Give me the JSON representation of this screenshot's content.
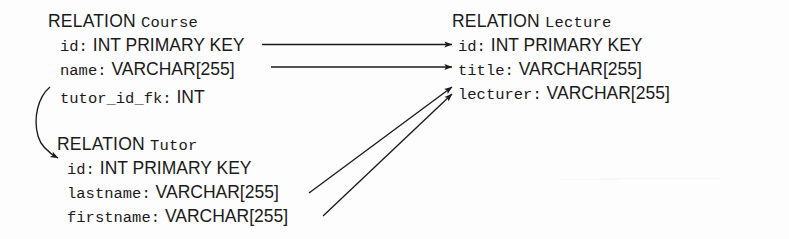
{
  "diagram": {
    "title_keyword": "RELATION",
    "relations": [
      {
        "id": "course",
        "name": "Course",
        "fields": [
          {
            "name": "id:",
            "type": "INT PRIMARY KEY"
          },
          {
            "name": "name:",
            "type": "VARCHAR[255]"
          },
          {
            "name": "tutor_id_fk:",
            "type": "INT"
          }
        ]
      },
      {
        "id": "lecture",
        "name": "Lecture",
        "fields": [
          {
            "name": "id:",
            "type": "INT PRIMARY KEY"
          },
          {
            "name": "title:",
            "type": "VARCHAR[255]"
          },
          {
            "name": "lecturer:",
            "type": "VARCHAR[255]"
          }
        ]
      },
      {
        "id": "tutor",
        "name": "Tutor",
        "fields": [
          {
            "name": "id:",
            "type": "INT PRIMARY KEY"
          },
          {
            "name": "lastname:",
            "type": "VARCHAR[255]"
          },
          {
            "name": "firstname:",
            "type": "VARCHAR[255]"
          }
        ]
      }
    ],
    "mappings": [
      {
        "id": "course-id-to-lecture-id",
        "from": "Course.id",
        "to": "Lecture.id",
        "style": "straight"
      },
      {
        "id": "course-name-to-lecture-title",
        "from": "Course.name",
        "to": "Lecture.title",
        "style": "straight"
      },
      {
        "id": "course-tutorid-to-tutor-id",
        "from": "Course.tutor_id_fk",
        "to": "Tutor.id",
        "style": "curved"
      },
      {
        "id": "tutor-lastname-to-lecture-lecturer",
        "from": "Tutor.lastname",
        "to": "Lecture.lecturer",
        "style": "diagonal"
      },
      {
        "id": "tutor-firstname-to-lecture-lecturer",
        "from": "Tutor.firstname",
        "to": "Lecture.lecturer",
        "style": "diagonal"
      }
    ],
    "colors": {
      "ink": "#1a1a1a",
      "background": "#fdfdfd"
    }
  }
}
